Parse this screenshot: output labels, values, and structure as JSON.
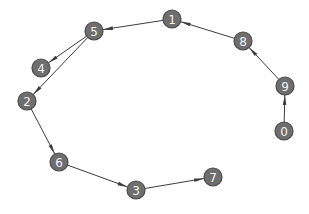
{
  "graph": {
    "type": "directed",
    "node_radius": 9,
    "colors": {
      "node_fill": "#6e6e6e",
      "node_stroke": "#4a4a4a",
      "label": "#f4f4f4",
      "edge": "#3c3c3c",
      "background": "#ffffff"
    },
    "nodes": [
      {
        "id": "0",
        "label": "0",
        "x": 284,
        "y": 131
      },
      {
        "id": "1",
        "label": "1",
        "x": 172,
        "y": 19
      },
      {
        "id": "2",
        "label": "2",
        "x": 27,
        "y": 101
      },
      {
        "id": "3",
        "label": "3",
        "x": 136,
        "y": 190
      },
      {
        "id": "4",
        "label": "4",
        "x": 41,
        "y": 68
      },
      {
        "id": "5",
        "label": "5",
        "x": 94,
        "y": 31
      },
      {
        "id": "6",
        "label": "6",
        "x": 59,
        "y": 162
      },
      {
        "id": "7",
        "label": "7",
        "x": 213,
        "y": 177
      },
      {
        "id": "8",
        "label": "8",
        "x": 243,
        "y": 41
      },
      {
        "id": "9",
        "label": "9",
        "x": 285,
        "y": 86
      }
    ],
    "edges": [
      {
        "source": "0",
        "target": "9"
      },
      {
        "source": "9",
        "target": "8"
      },
      {
        "source": "8",
        "target": "1"
      },
      {
        "source": "1",
        "target": "5"
      },
      {
        "source": "5",
        "target": "4"
      },
      {
        "source": "5",
        "target": "2"
      },
      {
        "source": "2",
        "target": "6"
      },
      {
        "source": "6",
        "target": "3"
      },
      {
        "source": "3",
        "target": "7"
      }
    ]
  }
}
